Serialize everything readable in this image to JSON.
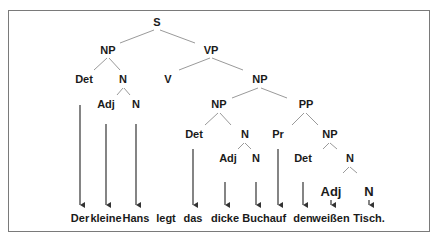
{
  "diagram": {
    "type": "syntax-tree",
    "sentence": [
      "Der",
      "kleine",
      "Hans",
      "legt",
      "das",
      "dicke",
      "Buch",
      "auf",
      "den",
      "weißen",
      "Tisch."
    ],
    "nodes": {
      "s": "S",
      "np1": "NP",
      "vp": "VP",
      "det1": "Det",
      "n1": "N",
      "v": "V",
      "np2": "NP",
      "adj1": "Adj",
      "n1b": "N",
      "np3": "NP",
      "pp": "PP",
      "det2": "Det",
      "n2": "N",
      "pr": "Pr",
      "np4": "NP",
      "adj2": "Adj",
      "n2b": "N",
      "det3": "Det",
      "n3": "N",
      "adj3": "Adj",
      "n3b": "N"
    },
    "words": {
      "w1": "Der",
      "w2": "kleine",
      "w3": "Hans",
      "w4": "legt",
      "w5": "das",
      "w6": "dicke",
      "w7": "Buch",
      "w8": "auf",
      "w9": "den",
      "w10": "weißen",
      "w11": "Tisch."
    }
  }
}
